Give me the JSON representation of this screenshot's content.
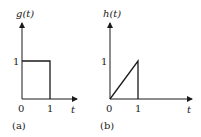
{
  "panels": [
    {
      "id": "a",
      "caption": "(a)",
      "y_label": "g(t)",
      "x_label": "t",
      "y_tick": "1",
      "x_ticks": [
        "0",
        "1"
      ],
      "shape": "rectangular pulse",
      "description": "g(t) = 1 for 0 <= t <= 1, else 0"
    },
    {
      "id": "b",
      "caption": "(b)",
      "y_label": "h(t)",
      "x_label": "t",
      "y_tick": "1",
      "x_ticks": [
        "0",
        "1"
      ],
      "shape": "ramp",
      "description": "h(t) = t for 0 <= t <= 1, else 0"
    }
  ],
  "colors": {
    "line": "#1a1a1a",
    "background": "#ffffff"
  }
}
